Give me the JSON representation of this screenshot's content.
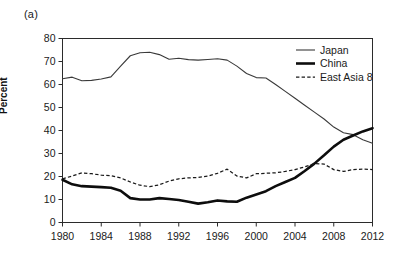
{
  "figure": {
    "panel_label": "(a)",
    "ylabel": "Percent"
  },
  "legend": {
    "position": "top-right-inside",
    "entries": [
      {
        "name": "japan",
        "label": "Japan",
        "style": "thin-solid"
      },
      {
        "name": "china",
        "label": "China",
        "style": "thick-solid"
      },
      {
        "name": "east-asia-8",
        "label": "East Asia 8",
        "style": "dashed"
      }
    ]
  },
  "chart_data": {
    "type": "line",
    "title": "",
    "subtitle": "",
    "panel": "(a)",
    "xlabel": "",
    "ylabel": "Percent",
    "xlim": [
      1980,
      2012
    ],
    "ylim": [
      0,
      80
    ],
    "grid": false,
    "legend_position": "top-right-inside",
    "xticks": [
      1980,
      1984,
      1988,
      1992,
      1996,
      2000,
      2004,
      2008,
      2012
    ],
    "xtick_labels": [
      "1980",
      "1984",
      "1988",
      "1992",
      "1996",
      "2000",
      "2004",
      "2008",
      "2012"
    ],
    "yticks": [
      0,
      10,
      20,
      30,
      40,
      50,
      60,
      70,
      80
    ],
    "ytick_labels": [
      "0",
      "10",
      "20",
      "30",
      "40",
      "50",
      "60",
      "70",
      "80"
    ],
    "x": [
      1980,
      1981,
      1982,
      1983,
      1984,
      1985,
      1986,
      1987,
      1988,
      1989,
      1990,
      1991,
      1992,
      1993,
      1994,
      1995,
      1996,
      1997,
      1998,
      1999,
      2000,
      2001,
      2002,
      2003,
      2004,
      2005,
      2006,
      2007,
      2008,
      2009,
      2010,
      2011,
      2012
    ],
    "series": [
      {
        "name": "Japan",
        "values": [
          62.5,
          63.2,
          61.6,
          61.8,
          62.4,
          63.3,
          68.0,
          72.5,
          73.8,
          74.0,
          73.0,
          71.0,
          71.4,
          70.8,
          70.6,
          70.9,
          71.2,
          70.6,
          68.0,
          64.8,
          63.0,
          62.8,
          60.0,
          57.0,
          54.0,
          51.0,
          48.0,
          45.0,
          41.5,
          39.0,
          38.2,
          36.0,
          34.5
        ]
      },
      {
        "name": "China",
        "values": [
          18.6,
          16.6,
          15.8,
          15.6,
          15.4,
          15.1,
          13.8,
          10.6,
          10.0,
          10.0,
          10.6,
          10.2,
          9.8,
          9.0,
          8.2,
          8.8,
          9.6,
          9.2,
          9.0,
          10.8,
          12.2,
          13.6,
          15.8,
          17.6,
          19.4,
          22.4,
          25.6,
          29.2,
          33.0,
          36.0,
          37.8,
          39.6,
          41.0
        ]
      },
      {
        "name": "East Asia 8",
        "values": [
          19.0,
          20.2,
          21.6,
          21.2,
          20.6,
          20.4,
          19.4,
          17.6,
          16.2,
          15.6,
          16.4,
          18.0,
          19.0,
          19.4,
          19.6,
          20.2,
          21.4,
          23.2,
          20.2,
          19.4,
          21.2,
          21.4,
          21.6,
          22.2,
          23.0,
          24.2,
          25.6,
          25.4,
          23.0,
          22.2,
          23.0,
          23.2,
          23.0
        ]
      }
    ]
  }
}
